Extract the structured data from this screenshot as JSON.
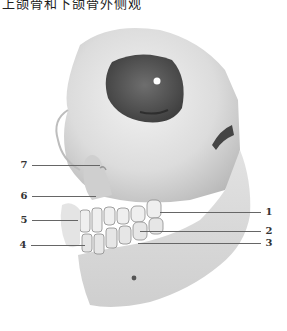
{
  "caption": "上颌骨和下颌骨外侧观",
  "figure": {
    "labels": [
      {
        "id": "1",
        "text": "1",
        "side": "right",
        "x": 264,
        "y": 207,
        "line_x1": 160,
        "line_x2": 261
      },
      {
        "id": "2",
        "text": "2",
        "side": "right",
        "x": 264,
        "y": 226,
        "line_x1": 140,
        "line_x2": 261
      },
      {
        "id": "3",
        "text": "3",
        "side": "right",
        "x": 264,
        "y": 238,
        "line_x1": 138,
        "line_x2": 261
      },
      {
        "id": "4",
        "text": "4",
        "side": "left",
        "x": 18,
        "y": 240,
        "line_x1": 31,
        "line_x2": 85
      },
      {
        "id": "5",
        "text": "5",
        "side": "left",
        "x": 19,
        "y": 215,
        "line_x1": 32,
        "line_x2": 78
      },
      {
        "id": "6",
        "text": "6",
        "side": "left",
        "x": 19,
        "y": 191,
        "line_x1": 32,
        "line_x2": 96
      },
      {
        "id": "7",
        "text": "7",
        "side": "left",
        "x": 19,
        "y": 160,
        "line_x1": 32,
        "line_x2": 100
      }
    ]
  }
}
